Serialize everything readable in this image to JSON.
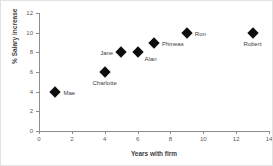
{
  "chart_data": {
    "type": "scatter",
    "title": "",
    "xlabel": "Years with firm",
    "ylabel": "% Salary increase",
    "xlim": [
      0,
      14
    ],
    "ylim": [
      0,
      12
    ],
    "xticks": [
      0,
      2,
      4,
      6,
      8,
      10,
      12,
      14
    ],
    "yticks": [
      0,
      2,
      4,
      6,
      8,
      10,
      12
    ],
    "grid": false,
    "legend": "none",
    "marker": "diamond",
    "marker_color": "#0d0d0d",
    "points": [
      {
        "label": "Mae",
        "x": 1,
        "y": 4,
        "label_pos": "right"
      },
      {
        "label": "Charlotte",
        "x": 4,
        "y": 6,
        "label_pos": "below"
      },
      {
        "label": "Jane",
        "x": 5,
        "y": 8,
        "label_pos": "left"
      },
      {
        "label": "Alan",
        "x": 6,
        "y": 8,
        "label_pos": "below-right"
      },
      {
        "label": "Phineas",
        "x": 7,
        "y": 9,
        "label_pos": "right"
      },
      {
        "label": "Ron",
        "x": 9,
        "y": 10,
        "label_pos": "right"
      },
      {
        "label": "Robert",
        "x": 13,
        "y": 10,
        "label_pos": "below"
      }
    ]
  }
}
